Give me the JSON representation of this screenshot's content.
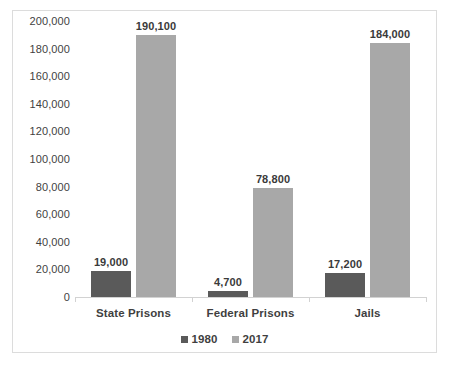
{
  "chart_data": {
    "type": "bar",
    "title": "",
    "subtitle": "",
    "xlabel": "",
    "ylabel": "",
    "categories": [
      "State Prisons",
      "Federal Prisons",
      "Jails"
    ],
    "series": [
      {
        "name": "1980",
        "color": "#5a5a5a",
        "values": [
          19000,
          4700,
          17200
        ],
        "value_labels": [
          "19,000",
          "4,700",
          "17,200"
        ]
      },
      {
        "name": "2017",
        "color": "#a8a8a8",
        "values": [
          190100,
          78800,
          184000
        ],
        "value_labels": [
          "190,100",
          "78,800",
          "184,000"
        ]
      }
    ],
    "ylim": [
      0,
      200000
    ],
    "ytick_step": 20000,
    "ytick_labels": [
      "200,000",
      "180,000",
      "160,000",
      "140,000",
      "120,000",
      "100,000",
      "80,000",
      "60,000",
      "40,000",
      "20,000",
      "0"
    ],
    "ytick_values": [
      200000,
      180000,
      160000,
      140000,
      120000,
      100000,
      80000,
      60000,
      40000,
      20000,
      0
    ],
    "grid": false,
    "legend_position": "bottom",
    "legend_entries": [
      "1980",
      "2017"
    ],
    "data_labels_shown": true,
    "border_color": "#dcdcdc",
    "axis_color": "#d2d2d2",
    "text_color": "#3f3f3f",
    "plot_background": "#ffffff"
  }
}
